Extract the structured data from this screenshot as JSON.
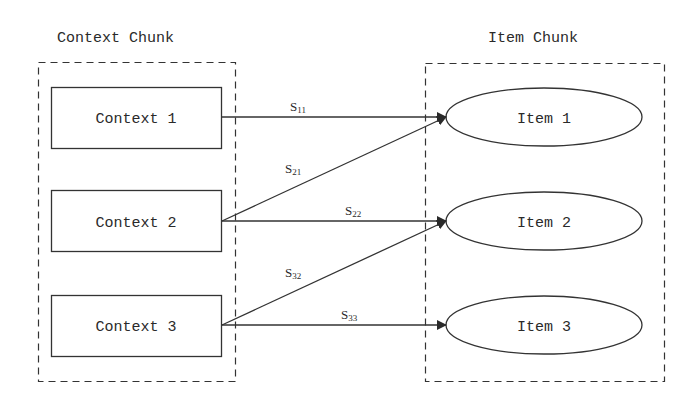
{
  "diagram": {
    "left_group": {
      "title": "Context Chunk",
      "nodes": [
        {
          "id": "c1",
          "label": "Context 1"
        },
        {
          "id": "c2",
          "label": "Context 2"
        },
        {
          "id": "c3",
          "label": "Context 3"
        }
      ]
    },
    "right_group": {
      "title": "Item Chunk",
      "nodes": [
        {
          "id": "i1",
          "label": "Item 1"
        },
        {
          "id": "i2",
          "label": "Item 2"
        },
        {
          "id": "i3",
          "label": "Item 3"
        }
      ]
    },
    "edges": [
      {
        "from": "Context 1",
        "to": "Item 1",
        "label_base": "S",
        "label_sub": "11"
      },
      {
        "from": "Context 2",
        "to": "Item 1",
        "label_base": "S",
        "label_sub": "21"
      },
      {
        "from": "Context 2",
        "to": "Item 2",
        "label_base": "S",
        "label_sub": "22"
      },
      {
        "from": "Context 3",
        "to": "Item 2",
        "label_base": "S",
        "label_sub": "32"
      },
      {
        "from": "Context 3",
        "to": "Item 3",
        "label_base": "S",
        "label_sub": "33"
      }
    ],
    "colors": {
      "stroke": "#333333",
      "text": "#2a2a2a",
      "background": "#ffffff"
    }
  }
}
